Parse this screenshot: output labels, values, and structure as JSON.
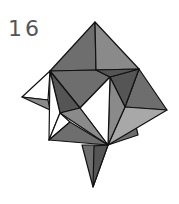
{
  "figure": {
    "step_number": "16"
  },
  "colors": {
    "light": "#a8a8a8",
    "mid": "#8a8a8a",
    "dark": "#6e6e6e",
    "darker": "#555555",
    "white": "#ffffff",
    "stroke": "#111111",
    "label": "#555555"
  }
}
